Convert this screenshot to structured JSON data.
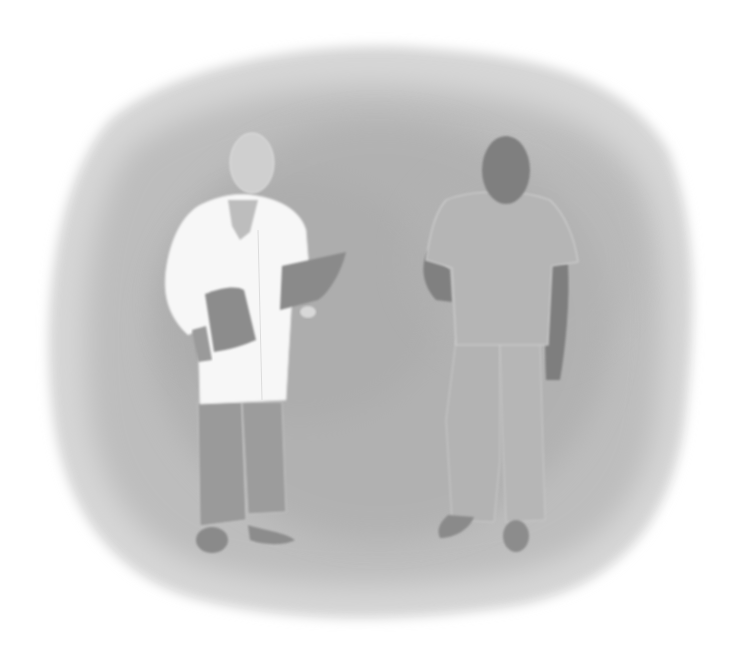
{
  "scene": {
    "description": "Grayscale watercolor illustration of two medical workers standing on a mottled gray background blob",
    "background": "#ffffff",
    "blob_outer": "#d6d6d6",
    "blob_mid": "#bdbdbd",
    "blob_inner": "#a9a9a9",
    "figures": [
      {
        "role": "doctor",
        "attire": "white lab coat",
        "holding": "clipboard and folder",
        "coat_color": "#f7f7f7",
        "skin_color": "#cfcfcf",
        "pants_color": "#9a9a9a",
        "shoe_color": "#8a8a8a",
        "folder_color": "#8c8c8c"
      },
      {
        "role": "nurse",
        "attire": "scrubs",
        "scrubs_color": "#b5b5b5",
        "skin_color": "#7f7f7f",
        "shoe_color": "#8a8a8a"
      }
    ]
  }
}
